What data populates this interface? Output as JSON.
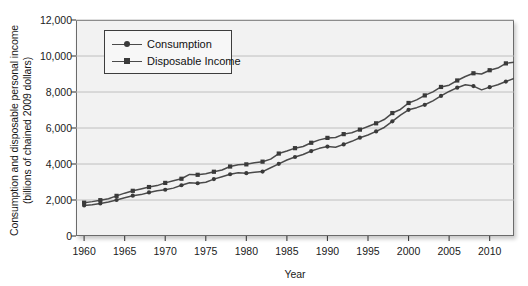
{
  "chart_data": {
    "type": "line",
    "title": "",
    "xlabel": "Year",
    "ylabel": "Consumption and disposable personal income\n(billions of chained 2009 dollars)",
    "xlim": [
      1959,
      2013
    ],
    "ylim": [
      0,
      12000
    ],
    "grid": true,
    "legend_position": "upper-left-inside",
    "ytick_labels": [
      "12,000",
      "10,000",
      "8,000",
      "6,000",
      "4,000",
      "2,000",
      "0"
    ],
    "ytick_values": [
      12000,
      10000,
      8000,
      6000,
      4000,
      2000,
      0
    ],
    "xtick_labels": [
      "1960",
      "1965",
      "1970",
      "1975",
      "1980",
      "1985",
      "1990",
      "1995",
      "2000",
      "2005",
      "2010"
    ],
    "xtick_values": [
      1960,
      1965,
      1970,
      1975,
      1980,
      1985,
      1990,
      1995,
      2000,
      2005,
      2010
    ],
    "x": [
      1960,
      1961,
      1962,
      1963,
      1964,
      1965,
      1966,
      1967,
      1968,
      1969,
      1970,
      1971,
      1972,
      1973,
      1974,
      1975,
      1976,
      1977,
      1978,
      1979,
      1980,
      1981,
      1982,
      1983,
      1984,
      1985,
      1986,
      1987,
      1988,
      1989,
      1990,
      1991,
      1992,
      1993,
      1994,
      1995,
      1996,
      1997,
      1998,
      1999,
      2000,
      2001,
      2002,
      2003,
      2004,
      2005,
      2006,
      2007,
      2008,
      2009,
      2010,
      2011,
      2012,
      2013
    ],
    "series": [
      {
        "name": "Consumption",
        "marker": "circle",
        "color": "#4a4a4a",
        "values": [
          1700,
          1730,
          1810,
          1890,
          2000,
          2120,
          2240,
          2300,
          2420,
          2510,
          2570,
          2660,
          2820,
          2960,
          2930,
          2990,
          3160,
          3290,
          3430,
          3510,
          3490,
          3540,
          3580,
          3790,
          4010,
          4220,
          4390,
          4530,
          4720,
          4870,
          4970,
          4930,
          5090,
          5260,
          5460,
          5610,
          5810,
          6030,
          6370,
          6720,
          7010,
          7130,
          7290,
          7510,
          7780,
          8030,
          8240,
          8400,
          8330,
          8120,
          8270,
          8400,
          8580,
          8750
        ]
      },
      {
        "name": "Disposable Income",
        "marker": "square",
        "color": "#4a4a4a",
        "values": [
          1850,
          1910,
          1990,
          2070,
          2230,
          2380,
          2510,
          2610,
          2720,
          2800,
          2950,
          3070,
          3180,
          3420,
          3400,
          3460,
          3570,
          3670,
          3860,
          3960,
          3980,
          4070,
          4130,
          4270,
          4580,
          4720,
          4880,
          4970,
          5180,
          5340,
          5450,
          5470,
          5660,
          5740,
          5910,
          6080,
          6260,
          6470,
          6830,
          7030,
          7390,
          7560,
          7810,
          8010,
          8280,
          8380,
          8640,
          8860,
          9040,
          9000,
          9210,
          9330,
          9590,
          9650
        ]
      }
    ]
  },
  "legend": {
    "items": [
      {
        "label": "Consumption",
        "marker": "circle"
      },
      {
        "label": "Disposable Income",
        "marker": "square"
      }
    ]
  },
  "axis": {
    "x_title": "Year",
    "y_title": "Consumption and disposable personal income\n(billions of chained 2009 dollars)"
  },
  "colors": {
    "plot_background": "#f2f2f2",
    "gridline": "#b9b9b9",
    "frame": "#6b6b6b",
    "line": "#4a4a4a",
    "marker": "#3a3a3a",
    "text": "#1a1a1a"
  }
}
